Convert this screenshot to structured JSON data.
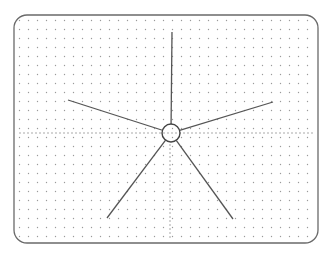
{
  "diagram": {
    "type": "radial-star",
    "frame": {
      "x": 14,
      "y": 15,
      "width": 304,
      "height": 228,
      "radius": 13,
      "stroke": "#6a6a6a"
    },
    "grid": {
      "spacing": 9,
      "origin_x": 19,
      "origin_y": 20,
      "dot_color": "#9a9a9a"
    },
    "axes": {
      "horizontal": {
        "y": 133,
        "x1": 20,
        "x2": 314,
        "dot_spacing": 4
      },
      "vertical": {
        "x": 170,
        "y1": 145,
        "y2": 240,
        "dot_spacing": 4
      }
    },
    "center": {
      "x": 171,
      "y": 133,
      "r": 9,
      "stroke": "#444444"
    },
    "arms": [
      {
        "name": "arm-up",
        "x2": 172,
        "y2": 32
      },
      {
        "name": "arm-upper-right",
        "x2": 273,
        "y2": 102
      },
      {
        "name": "arm-upper-left",
        "x2": 68,
        "y2": 100
      },
      {
        "name": "arm-lower-left",
        "x2": 107,
        "y2": 218
      },
      {
        "name": "arm-lower-right",
        "x2": 233,
        "y2": 219
      }
    ],
    "arm_color": "#555555"
  }
}
